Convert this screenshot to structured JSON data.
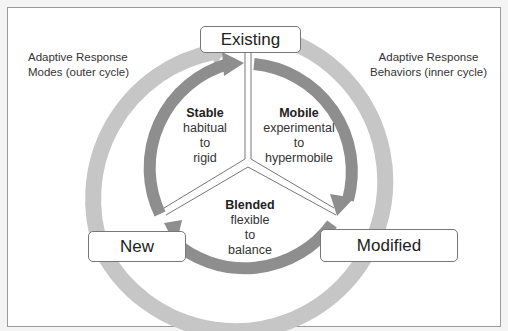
{
  "diagram": {
    "nodes": {
      "existing": "Existing",
      "new": "New",
      "modified": "Modified"
    },
    "captions": {
      "outer_line1": "Adaptive Response",
      "outer_line2": "Modes (outer cycle)",
      "inner_line1": "Adaptive Response",
      "inner_line2": "Behaviors (inner cycle)"
    },
    "segments": {
      "stable": {
        "title": "Stable",
        "line1": "habitual",
        "line2": "to",
        "line3": "rigid"
      },
      "mobile": {
        "title": "Mobile",
        "line1": "experimental",
        "line2": "to",
        "line3": "hypermobile"
      },
      "blended": {
        "title": "Blended",
        "line1": "flexible",
        "line2": "to",
        "line3": "balance"
      }
    },
    "colors": {
      "outer_ring": "#c6c6c6",
      "inner_ring": "#8e8e8e",
      "frame_border": "#9a9a9a"
    }
  }
}
